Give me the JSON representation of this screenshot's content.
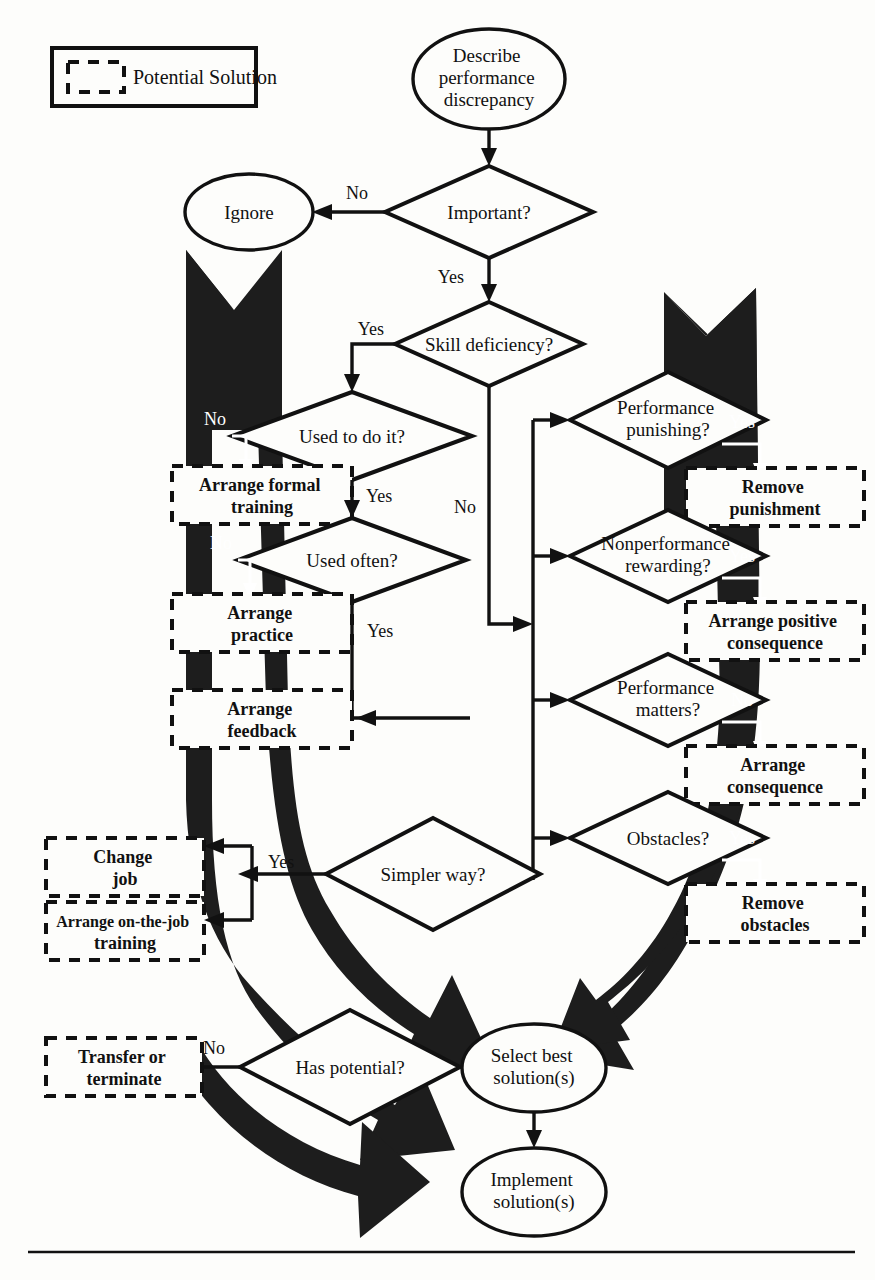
{
  "figure": {
    "type": "flowchart",
    "legend": {
      "label": "Potential Solution",
      "swatch": "dashed-box-icon"
    }
  },
  "nodes": {
    "start": {
      "label": "Describe\nperformance\ndiscrepancy",
      "shape": "ellipse"
    },
    "ignore": {
      "label": "Ignore",
      "shape": "ellipse"
    },
    "important": {
      "label": "Important?",
      "shape": "diamond"
    },
    "skill_deficiency": {
      "label": "Skill deficiency?",
      "shape": "diamond"
    },
    "used_to_do_it": {
      "label": "Used to do it?",
      "shape": "diamond"
    },
    "used_often": {
      "label": "Used often?",
      "shape": "diamond"
    },
    "simpler_way": {
      "label": "Simpler way?",
      "shape": "diamond"
    },
    "has_potential": {
      "label": "Has potential?",
      "shape": "diamond"
    },
    "performance_punishing": {
      "label": "Performance\npunishing?",
      "shape": "diamond"
    },
    "nonperformance_rewarding": {
      "label": "Nonperformance\nrewarding?",
      "shape": "diamond"
    },
    "performance_matters": {
      "label": "Performance\nmatters?",
      "shape": "diamond"
    },
    "obstacles": {
      "label": "Obstacles?",
      "shape": "diamond"
    },
    "select_best": {
      "label": "Select best\nsolution(s)",
      "shape": "ellipse"
    },
    "implement": {
      "label": "Implement\nsolution(s)",
      "shape": "ellipse"
    }
  },
  "solutions": [
    {
      "id": "arrange-formal-training",
      "label": "Arrange formal\ntraining"
    },
    {
      "id": "arrange-practice",
      "label": "Arrange\npractice"
    },
    {
      "id": "arrange-feedback",
      "label": "Arrange\nfeedback"
    },
    {
      "id": "change-job",
      "label": "Change\njob"
    },
    {
      "id": "arrange-on-the-job-training",
      "label": "Arrange on-the-job\ntraining"
    },
    {
      "id": "transfer-or-terminate",
      "label": "Transfer or\nterminate"
    },
    {
      "id": "remove-punishment",
      "label": "Remove\npunishment"
    },
    {
      "id": "arrange-positive-consequence",
      "label": "Arrange positive\nconsequence"
    },
    {
      "id": "arrange-consequence",
      "label": "Arrange\nconsequence"
    },
    {
      "id": "remove-obstacles",
      "label": "Remove\nobstacles"
    }
  ],
  "edge_labels": {
    "important_no": "No",
    "important_yes": "Yes",
    "skill_yes": "Yes",
    "skill_no": "No",
    "used_to_do_it_no": "No",
    "used_to_do_it_yes": "Yes",
    "used_often_no": "No",
    "used_often_yes": "Yes",
    "simpler_way_yes": "Yes",
    "has_potential_no": "No",
    "punishing_yes": "Yes",
    "rewarding_yes": "Yes",
    "matters_no": "No",
    "obstacles_yes": "Yes"
  },
  "colors": {
    "ink": "#111111",
    "paper": "#fdfdfb",
    "band": "#1d1d1d",
    "reverse_text": "#ffffff"
  }
}
